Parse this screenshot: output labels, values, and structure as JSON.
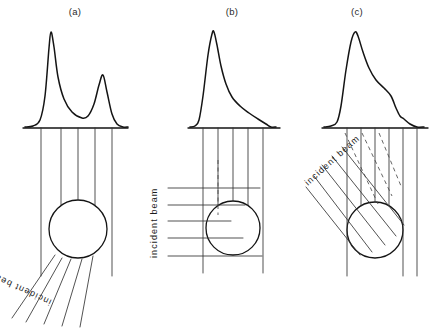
{
  "figure": {
    "background_color": "#ffffff",
    "ink_color": "#141414",
    "ray_color": "#333333",
    "width": 436,
    "height": 330
  },
  "panels": [
    {
      "id": "a",
      "caption": "(a)",
      "caption_x": 75,
      "caption_y": 15,
      "beam_label": "incident beam",
      "beam_label_rotation": 205,
      "beam_label_x": 52,
      "beam_label_y": 300,
      "geometry": "transmission-forward-scatter",
      "axis": {
        "x1": 23,
        "x2": 128,
        "y": 128
      },
      "circle": {
        "cx": 78,
        "cy": 229,
        "r": 29
      },
      "vertical_rays_x": [
        41,
        61,
        78,
        95,
        112
      ],
      "profile_label": "bimodal double-peak distribution",
      "curve_points": [
        [
          25,
          127
        ],
        [
          33,
          126
        ],
        [
          40,
          120
        ],
        [
          45,
          96
        ],
        [
          49,
          48
        ],
        [
          51,
          32
        ],
        [
          54,
          47
        ],
        [
          58,
          77
        ],
        [
          64,
          99
        ],
        [
          72,
          112
        ],
        [
          82,
          118
        ],
        [
          88,
          116
        ],
        [
          94,
          104
        ],
        [
          99,
          85
        ],
        [
          103,
          75
        ],
        [
          107,
          92
        ],
        [
          112,
          114
        ],
        [
          117,
          124
        ],
        [
          123,
          127
        ],
        [
          128,
          127
        ]
      ],
      "incident_rays": [
        [
          55,
          255,
          12,
          318
        ],
        [
          62,
          258,
          26,
          322
        ],
        [
          71,
          259,
          44,
          324
        ],
        [
          82,
          259,
          62,
          326
        ],
        [
          93,
          256,
          80,
          327
        ]
      ]
    },
    {
      "id": "b",
      "caption": "(b)",
      "caption_x": 232,
      "caption_y": 15,
      "beam_label": "incident beam",
      "beam_label_rotation": -90,
      "beam_label_x": 157,
      "beam_label_y": 258,
      "geometry": "side-incidence-asymmetric",
      "axis": {
        "x1": 188,
        "x2": 280,
        "y": 128
      },
      "circle": {
        "cx": 233,
        "cy": 228,
        "r": 27
      },
      "vertical_rays_x": [
        203,
        218,
        233,
        248,
        263
      ],
      "profile_label": "sharp peak with long tail",
      "curve_points": [
        [
          190,
          127
        ],
        [
          195,
          126
        ],
        [
          199,
          120
        ],
        [
          203,
          96
        ],
        [
          208,
          55
        ],
        [
          212,
          34
        ],
        [
          214,
          32
        ],
        [
          217,
          45
        ],
        [
          221,
          66
        ],
        [
          226,
          84
        ],
        [
          232,
          97
        ],
        [
          240,
          106
        ],
        [
          249,
          113
        ],
        [
          258,
          119
        ],
        [
          266,
          124
        ],
        [
          271,
          127
        ],
        [
          276,
          127
        ]
      ],
      "incident_rays": [
        [
          168,
          188,
          260,
          188
        ],
        [
          168,
          205,
          245,
          205
        ],
        [
          168,
          221,
          231,
          221
        ],
        [
          168,
          238,
          243,
          238
        ],
        [
          168,
          256,
          262,
          256
        ]
      ],
      "incident_rays_dashed": [
        [
          218,
          160,
          218,
          215
        ]
      ]
    },
    {
      "id": "c",
      "caption": "(c)",
      "caption_x": 357,
      "caption_y": 15,
      "beam_label": "incident beam",
      "beam_label_rotation": -42,
      "beam_label_x": 308,
      "beam_label_y": 186,
      "geometry": "oblique-incidence-shoulder",
      "axis": {
        "x1": 322,
        "x2": 428,
        "y": 128
      },
      "circle": {
        "cx": 375,
        "cy": 230,
        "r": 28
      },
      "vertical_rays_x": [
        347,
        361,
        375,
        389,
        403,
        417
      ],
      "profile_label": "steep rise with shoulder decay",
      "curve_points": [
        [
          324,
          127
        ],
        [
          331,
          126
        ],
        [
          337,
          122
        ],
        [
          341,
          106
        ],
        [
          346,
          70
        ],
        [
          351,
          42
        ],
        [
          355,
          32
        ],
        [
          358,
          36
        ],
        [
          363,
          52
        ],
        [
          369,
          68
        ],
        [
          376,
          80
        ],
        [
          384,
          88
        ],
        [
          391,
          96
        ],
        [
          396,
          108
        ],
        [
          400,
          116
        ],
        [
          404,
          119
        ],
        [
          410,
          124
        ],
        [
          417,
          127
        ],
        [
          424,
          127
        ]
      ],
      "incident_rays": [
        [
          306,
          187,
          360,
          255
        ],
        [
          314,
          176,
          372,
          252
        ],
        [
          322,
          165,
          385,
          245
        ],
        [
          332,
          156,
          396,
          236
        ],
        [
          342,
          147,
          404,
          225
        ]
      ],
      "incident_rays_dashed": [
        [
          345,
          133,
          378,
          204
        ],
        [
          362,
          133,
          392,
          196
        ],
        [
          379,
          133,
          401,
          186
        ]
      ]
    }
  ]
}
